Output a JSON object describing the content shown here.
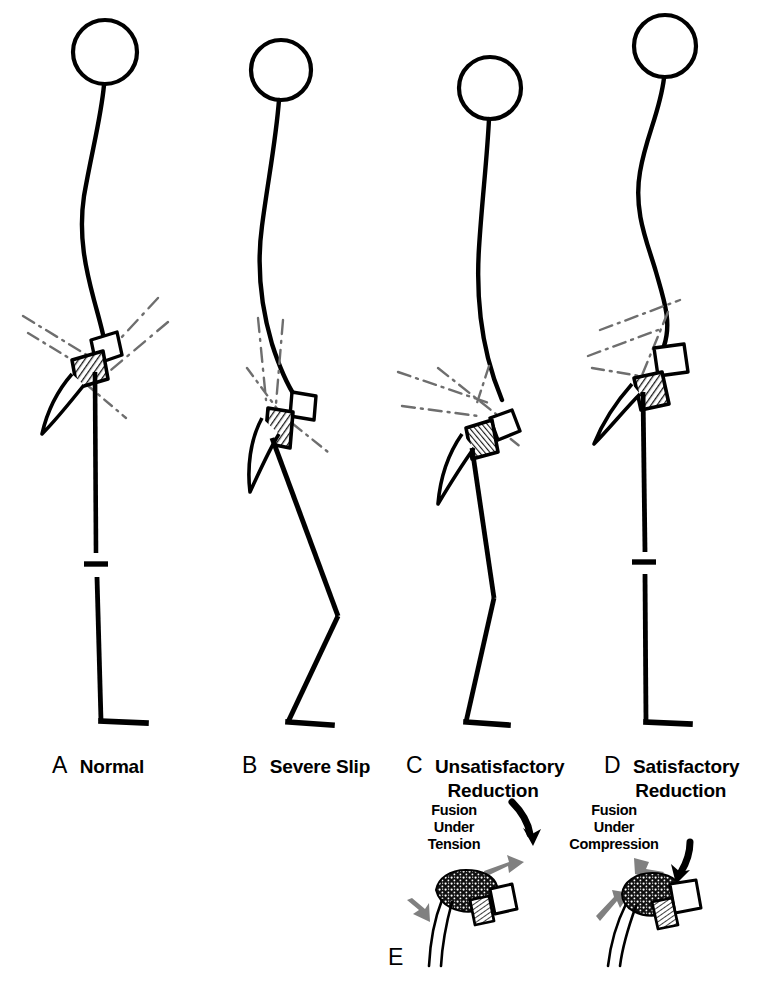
{
  "figure": {
    "kind": "medical-line-drawing",
    "background_color": "#ffffff",
    "ink_color": "#000000",
    "reference_line_color": "#6e6e6e",
    "gray_arrow_color": "#808080",
    "shaded_vertebra_color": "#555555"
  },
  "panels": [
    {
      "id": "A",
      "letter": "A",
      "label_line1": "Normal",
      "label_line2": "",
      "letter_x": 56,
      "letter_y": 766,
      "text_x": 79,
      "text_y": 768,
      "description": "Normal sagittal alignment with vertical leg and plantigrade foot"
    },
    {
      "id": "B",
      "letter": "B",
      "label_line1": "Severe Slip",
      "label_line2": "",
      "letter_x": 246,
      "letter_y": 766,
      "text_x": 269,
      "text_y": 768,
      "description": "Severe slip with flexed hip and knee, crouched posture"
    },
    {
      "id": "C",
      "letter": "C",
      "label_line1": "Unsatisfactory",
      "label_line2": "Reduction",
      "letter_x": 410,
      "letter_y": 766,
      "text_x": 433,
      "text_y": 768,
      "description": "Unsatisfactory reduction, residual slip and knee flexion"
    },
    {
      "id": "D",
      "letter": "D",
      "label_line1": "Satisfactory",
      "label_line2": "Reduction",
      "letter_x": 608,
      "letter_y": 766,
      "text_x": 632,
      "text_y": 768,
      "description": "Satisfactory reduction with restored sagittal balance"
    },
    {
      "id": "E",
      "letter": "E",
      "label_line1": "",
      "label_line2": "",
      "letter_x": 390,
      "letter_y": 948,
      "text_x": 0,
      "text_y": 0,
      "description": "Lumbosacral fusion force diagrams"
    }
  ],
  "force_diagrams": [
    {
      "id": "tension",
      "caption_lines": [
        "Fusion",
        "Under",
        "Tension"
      ],
      "caption_x": 417,
      "caption_y": 800,
      "black_arrow": "curved-down-right",
      "gray_arrows": [
        "up-right",
        "down-left"
      ]
    },
    {
      "id": "compression",
      "caption_lines": [
        "Fusion",
        "Under",
        "Compression"
      ],
      "caption_x": 590,
      "caption_y": 800,
      "black_arrow": "curved-down-left",
      "gray_arrows": [
        "down-right",
        "up-right"
      ]
    }
  ],
  "bottom_caption": ""
}
